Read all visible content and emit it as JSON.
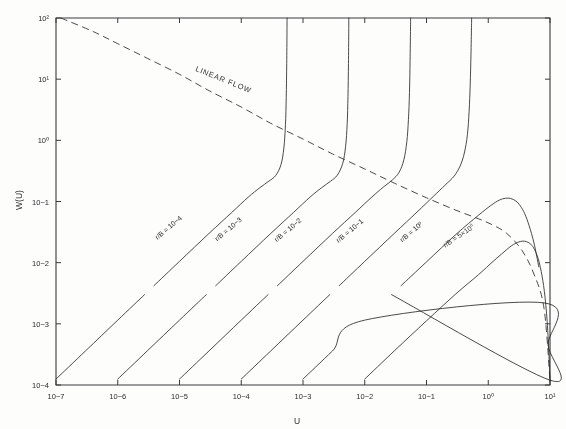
{
  "chart_data": {
    "type": "line",
    "title": "",
    "xlabel": "U",
    "ylabel": "W(U)",
    "xscale": "log",
    "yscale": "log",
    "xlim": [
      1e-07,
      10.0
    ],
    "ylim": [
      0.0001,
      100.0
    ],
    "x_reversed": false,
    "grid": false,
    "legend": "inline-labels",
    "xtick_labels": [
      "10−7",
      "10−6",
      "10−5",
      "10−4",
      "10−3",
      "10−2",
      "10−1",
      "10⁰",
      "10¹"
    ],
    "xtick_values": [
      1e-07,
      1e-06,
      1e-05,
      0.0001,
      0.001,
      0.01,
      0.1,
      1,
      10
    ],
    "ytick_labels": [
      "10²",
      "10¹",
      "10⁰",
      "10−1",
      "10−2",
      "10−3",
      "10−4"
    ],
    "ytick_values": [
      100,
      10,
      1,
      0.1,
      0.01,
      0.001,
      0.0001
    ],
    "annotations": [
      {
        "name": "linear-flow-label",
        "text": "LINEAR  FLOW",
        "x": 5e-05,
        "y": 9.0,
        "rotation": 22
      }
    ],
    "envelope": {
      "name": "linear-flow-envelope",
      "style": "dashed",
      "points": [
        [
          1.2e-07,
          100
        ],
        [
          4e-07,
          60
        ],
        [
          1e-06,
          38
        ],
        [
          3e-06,
          22
        ],
        [
          1e-05,
          12
        ],
        [
          3e-05,
          6.5
        ],
        [
          0.0001,
          3.5
        ],
        [
          0.0003,
          1.9
        ],
        [
          0.001,
          1.05
        ],
        [
          0.003,
          0.6
        ],
        [
          0.01,
          0.34
        ],
        [
          0.03,
          0.2
        ],
        [
          0.1,
          0.115
        ],
        [
          0.3,
          0.072
        ],
        [
          0.7,
          0.052
        ],
        [
          1.2,
          0.041
        ],
        [
          2.0,
          0.03
        ],
        [
          3.5,
          0.016
        ],
        [
          5.5,
          0.0065
        ],
        [
          8.0,
          0.0018
        ],
        [
          10.0,
          0.00012
        ]
      ]
    },
    "series": [
      {
        "name": "curve-rb-1e-4",
        "label": "r/B = 10−4",
        "label_x": 7e-06,
        "label_y": 0.035,
        "label_rotation": -40,
        "break_gap": [
          0.003,
          0.0042
        ],
        "points": [
          [
            1e-07,
            0.000125
          ],
          [
            3e-07,
            0.00036
          ],
          [
            1e-06,
            0.00115
          ],
          [
            3e-06,
            0.0033
          ],
          [
            1e-05,
            0.0105
          ],
          [
            3e-05,
            0.03
          ],
          [
            7e-05,
            0.066
          ],
          [
            0.00013,
            0.118
          ],
          [
            0.0002,
            0.168
          ],
          [
            0.00028,
            0.215
          ],
          [
            0.00036,
            0.265
          ],
          [
            0.00044,
            0.4
          ],
          [
            0.00049,
            0.75
          ],
          [
            0.00052,
            1.8
          ],
          [
            0.000535,
            5.0
          ],
          [
            0.000545,
            18.0
          ],
          [
            0.00055,
            55.0
          ],
          [
            0.000552,
            100
          ]
        ]
      },
      {
        "name": "curve-rb-1e-3",
        "label": "r/B = 10−3",
        "label_x": 6.5e-05,
        "label_y": 0.033,
        "label_rotation": -40,
        "break_gap": [
          0.003,
          0.0042
        ],
        "points": [
          [
            1e-06,
            0.000125
          ],
          [
            3e-06,
            0.00036
          ],
          [
            1e-05,
            0.00115
          ],
          [
            3e-05,
            0.0033
          ],
          [
            0.0001,
            0.0105
          ],
          [
            0.0003,
            0.03
          ],
          [
            0.0007,
            0.066
          ],
          [
            0.0013,
            0.118
          ],
          [
            0.002,
            0.168
          ],
          [
            0.0028,
            0.215
          ],
          [
            0.0036,
            0.27
          ],
          [
            0.0044,
            0.42
          ],
          [
            0.0049,
            0.8
          ],
          [
            0.0052,
            1.9
          ],
          [
            0.00535,
            5.2
          ],
          [
            0.00545,
            18.0
          ],
          [
            0.0055,
            55.0
          ],
          [
            0.00552,
            100
          ]
        ]
      },
      {
        "name": "curve-rb-1e-2",
        "label": "r/B = 10−2",
        "label_x": 0.0006,
        "label_y": 0.032,
        "label_rotation": -40,
        "break_gap": [
          0.003,
          0.0042
        ],
        "points": [
          [
            1e-05,
            0.000125
          ],
          [
            3e-05,
            0.00036
          ],
          [
            0.0001,
            0.00115
          ],
          [
            0.0003,
            0.0033
          ],
          [
            0.001,
            0.0105
          ],
          [
            0.003,
            0.03
          ],
          [
            0.007,
            0.066
          ],
          [
            0.013,
            0.118
          ],
          [
            0.02,
            0.172
          ],
          [
            0.028,
            0.225
          ],
          [
            0.036,
            0.3
          ],
          [
            0.043,
            0.48
          ],
          [
            0.048,
            0.95
          ],
          [
            0.051,
            2.2
          ],
          [
            0.053,
            6.0
          ],
          [
            0.0542,
            20.0
          ],
          [
            0.055,
            60.0
          ],
          [
            0.0553,
            100
          ]
        ]
      },
      {
        "name": "curve-rb-1e-1",
        "label": "r/B = 10−1",
        "label_x": 0.006,
        "label_y": 0.031,
        "label_rotation": -40,
        "break_gap": [
          0.003,
          0.0042
        ],
        "points": [
          [
            0.0001,
            0.000125
          ],
          [
            0.0003,
            0.00036
          ],
          [
            0.001,
            0.00115
          ],
          [
            0.003,
            0.0033
          ],
          [
            0.01,
            0.0105
          ],
          [
            0.03,
            0.03
          ],
          [
            0.07,
            0.067
          ],
          [
            0.13,
            0.122
          ],
          [
            0.2,
            0.185
          ],
          [
            0.28,
            0.26
          ],
          [
            0.35,
            0.38
          ],
          [
            0.41,
            0.62
          ],
          [
            0.46,
            1.25
          ],
          [
            0.49,
            3.0
          ],
          [
            0.51,
            8.0
          ],
          [
            0.525,
            25.0
          ],
          [
            0.535,
            70.0
          ],
          [
            0.538,
            100
          ]
        ]
      },
      {
        "name": "curve-rb-1e0",
        "label": "r/B = 10⁰",
        "label_x": 0.06,
        "label_y": 0.03,
        "label_rotation": -40,
        "break_gap": [
          0.003,
          0.0042
        ],
        "points": [
          [
            0.001,
            0.000125
          ],
          [
            0.003,
            0.00036
          ],
          [
            0.01,
            0.00115
          ],
          [
            0.03,
            0.0033
          ],
          [
            0.1,
            0.0103
          ],
          [
            0.3,
            0.029
          ],
          [
            0.7,
            0.06
          ],
          [
            1.1,
            0.086
          ],
          [
            1.5,
            0.105
          ],
          [
            1.9,
            0.113
          ],
          [
            2.3,
            0.112
          ],
          [
            2.8,
            0.102
          ],
          [
            3.3,
            0.085
          ],
          [
            3.9,
            0.063
          ],
          [
            4.6,
            0.04
          ],
          [
            5.5,
            0.021
          ],
          [
            6.6,
            0.0085
          ],
          [
            8.0,
            0.0022
          ],
          [
            9.3,
            0.00045
          ],
          [
            10.0,
            0.00012
          ]
        ]
      },
      {
        "name": "curve-rb-5e0",
        "label": "r/B = 5×10⁰",
        "label_x": 0.35,
        "label_y": 0.0255,
        "label_rotation": -34,
        "break_gap": null,
        "points": [
          [
            0.01,
            0.000125
          ],
          [
            0.03,
            0.00036
          ],
          [
            0.1,
            0.00112
          ],
          [
            0.3,
            0.0031
          ],
          [
            0.7,
            0.0064
          ],
          [
            1.2,
            0.0105
          ],
          [
            1.8,
            0.015
          ],
          [
            2.4,
            0.019
          ],
          [
            3.0,
            0.0215
          ],
          [
            3.6,
            0.0225
          ],
          [
            4.2,
            0.022
          ],
          [
            4.9,
            0.02
          ],
          [
            5.6,
            0.0165
          ],
          [
            6.4,
            0.0118
          ],
          [
            7.2,
            0.0072
          ],
          [
            8.1,
            0.0034
          ],
          [
            9.0,
            0.0011
          ],
          [
            9.7,
            0.00026
          ],
          [
            10.0,
            0.000115
          ]
        ]
      }
    ]
  },
  "style": {
    "line_color": "#2b2b2b",
    "axis_color": "#3a3a3a",
    "text_color": "#2b2b2b",
    "background": "#fdfdfc"
  }
}
